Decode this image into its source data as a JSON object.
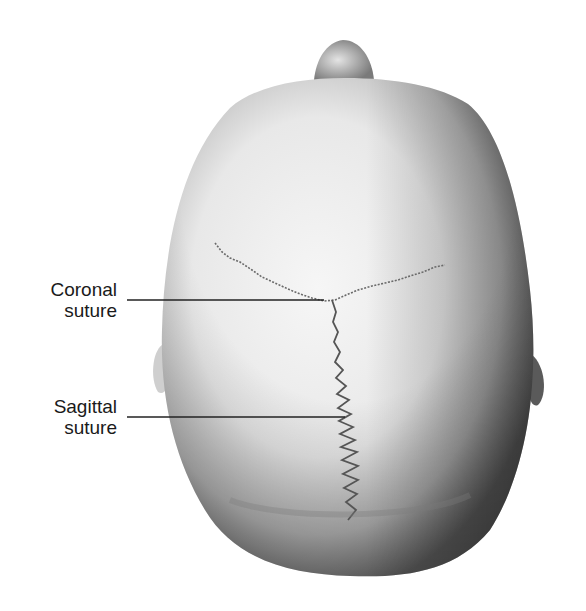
{
  "figure": {
    "labels": [
      {
        "id": "coronal",
        "line1": "Coronal",
        "line2": "suture"
      },
      {
        "id": "sagittal",
        "line1": "Sagittal",
        "line2": "suture"
      }
    ],
    "colors": {
      "background": "#ffffff",
      "skull_light": "#f2f2f2",
      "skull_shadow": "#6e6e6e",
      "suture": "#5a5a5a",
      "leader_line": "#222222",
      "text": "#1a1a1a"
    }
  }
}
